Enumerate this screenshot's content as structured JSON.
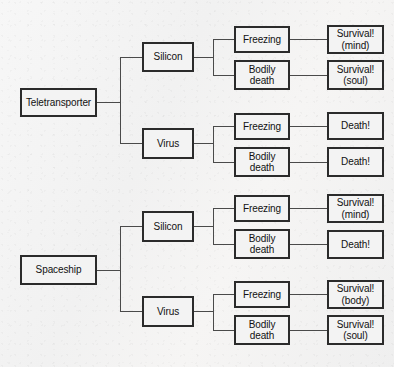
{
  "diagram": {
    "type": "decision-tree",
    "title": "",
    "orientation": "left-to-right",
    "levels": [
      "method",
      "substrate",
      "process",
      "outcome"
    ],
    "nodes": {
      "root_teletransporter": "Teletransporter",
      "root_spaceship": "Spaceship",
      "t_silicon": "Silicon",
      "t_virus": "Virus",
      "s_silicon": "Silicon",
      "s_virus": "Virus",
      "t_si_freezing": "Freezing",
      "t_si_bodily": "Bodily\ndeath",
      "t_vi_freezing": "Freezing",
      "t_vi_bodily": "Bodily\ndeath",
      "s_si_freezing": "Freezing",
      "s_si_bodily": "Bodily\ndeath",
      "s_vi_freezing": "Freezing",
      "s_vi_bodily": "Bodily\ndeath",
      "t_si_fr_out": "Survival!\n(mind)",
      "t_si_bd_out": "Survival!\n(soul)",
      "t_vi_fr_out": "Death!",
      "t_vi_bd_out": "Death!",
      "s_si_fr_out": "Survival!\n(mind)",
      "s_si_bd_out": "Death!",
      "s_vi_fr_out": "Survival!\n(body)",
      "s_vi_bd_out": "Survival!\n(soul)"
    },
    "paths": [
      [
        "Teletransporter",
        "Silicon",
        "Freezing",
        "Survival! (mind)"
      ],
      [
        "Teletransporter",
        "Silicon",
        "Bodily death",
        "Survival! (soul)"
      ],
      [
        "Teletransporter",
        "Virus",
        "Freezing",
        "Death!"
      ],
      [
        "Teletransporter",
        "Virus",
        "Bodily death",
        "Death!"
      ],
      [
        "Spaceship",
        "Silicon",
        "Freezing",
        "Survival! (mind)"
      ],
      [
        "Spaceship",
        "Silicon",
        "Bodily death",
        "Death!"
      ],
      [
        "Spaceship",
        "Virus",
        "Freezing",
        "Survival! (body)"
      ],
      [
        "Spaceship",
        "Virus",
        "Bodily death",
        "Survival! (soul)"
      ]
    ],
    "colors": {
      "border": "#2b2b2b",
      "box_fill": "#f3f3f3",
      "connector": "#4a4a4a",
      "background": "#f4f4f4",
      "text": "#111111"
    }
  }
}
